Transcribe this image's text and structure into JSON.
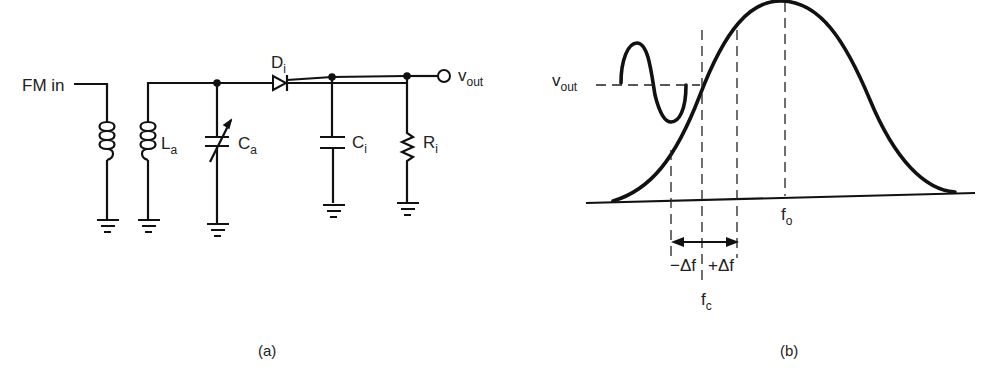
{
  "figure_a": {
    "caption": "(a)",
    "input_label": "FM in",
    "primary_coil": "primary-inductor",
    "secondary_coil": {
      "name": "L",
      "sub": "a"
    },
    "tuning_cap": {
      "name": "C",
      "sub": "a"
    },
    "diode": {
      "name": "D",
      "sub": "i"
    },
    "filter_cap": {
      "name": "C",
      "sub": "i"
    },
    "load_resistor": {
      "name": "R",
      "sub": "i"
    },
    "output": {
      "name": "v",
      "sub": "out"
    }
  },
  "figure_b": {
    "caption": "(b)",
    "vout": {
      "name": "v",
      "sub": "out"
    },
    "center_freq": {
      "name": "f",
      "sub": "c"
    },
    "resonant_freq": {
      "name": "f",
      "sub": "o"
    },
    "minus_dev": "−Δf",
    "plus_dev": "+Δf"
  }
}
